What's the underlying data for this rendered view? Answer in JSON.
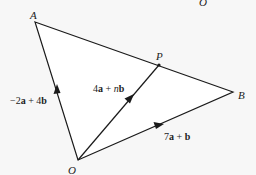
{
  "diagram": {
    "type": "vector-triangle",
    "points": {
      "A": {
        "label": "A",
        "x": 35,
        "y": 22
      },
      "B": {
        "label": "B",
        "x": 233,
        "y": 92
      },
      "O": {
        "label": "O",
        "x": 78,
        "y": 160
      },
      "P": {
        "label": "P",
        "x": 159,
        "y": 65
      }
    },
    "stray_label": "O",
    "vectors": {
      "OA": {
        "coef1": "−2",
        "v1": "a",
        "op": " + ",
        "coef2": "4",
        "v2": "b"
      },
      "OP": {
        "coef1": "4",
        "v1": "a",
        "op": " + ",
        "coef2": "n",
        "v2": "b"
      },
      "OB": {
        "coef1": "7",
        "v1": "a",
        "op": " + ",
        "coef2": "",
        "v2": "b"
      }
    },
    "colors": {
      "background": "#f7f7f7",
      "fill": "#ffffff",
      "stroke": "#1a1a1a"
    }
  }
}
